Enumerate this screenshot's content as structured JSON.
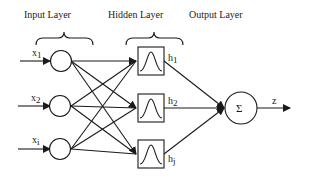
{
  "diagram": {
    "type": "neural-network",
    "title": "",
    "layers": [
      {
        "name": "input",
        "label": "Input Layer",
        "nodes": [
          {
            "label": "x",
            "subscript": "1"
          },
          {
            "label": "x",
            "subscript": "2"
          },
          {
            "label": "x",
            "subscript": "i"
          }
        ]
      },
      {
        "name": "hidden",
        "label": "Hidden Layer",
        "nodes": [
          {
            "label": "h",
            "subscript": "1"
          },
          {
            "label": "h",
            "subscript": "2"
          },
          {
            "label": "h",
            "subscript": "j"
          }
        ]
      },
      {
        "name": "output",
        "label": "Output Layer",
        "nodes": [
          {
            "symbol": "Σ",
            "output_label": "z"
          }
        ]
      }
    ],
    "connections": "fully connected input→hidden; all hidden→output sum node",
    "colors": {
      "stroke": "#1a1a1a",
      "background": "#ffffff"
    }
  }
}
